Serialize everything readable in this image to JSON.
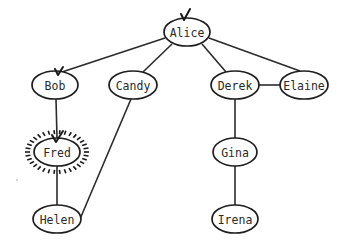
{
  "diagram": {
    "type": "graph",
    "colors": {
      "stroke": "#1e1e1e",
      "edge": "#2b2b2b",
      "background": "#ffffff",
      "label": "#2a2a2a"
    },
    "nodes": [
      {
        "id": "alice",
        "label": "Alice",
        "cx": 187,
        "cy": 32,
        "checked": true,
        "highlighted": false
      },
      {
        "id": "bob",
        "label": "Bob",
        "cx": 55,
        "cy": 85,
        "checked": true,
        "highlighted": false
      },
      {
        "id": "candy",
        "label": "Candy",
        "cx": 133,
        "cy": 85,
        "checked": false,
        "highlighted": false
      },
      {
        "id": "derek",
        "label": "Derek",
        "cx": 235,
        "cy": 85,
        "checked": false,
        "highlighted": false
      },
      {
        "id": "elaine",
        "label": "Elaine",
        "cx": 304,
        "cy": 85,
        "checked": false,
        "highlighted": false
      },
      {
        "id": "fred",
        "label": "Fred",
        "cx": 57,
        "cy": 152,
        "checked": true,
        "highlighted": true
      },
      {
        "id": "gina",
        "label": "Gina",
        "cx": 235,
        "cy": 152,
        "checked": false,
        "highlighted": false
      },
      {
        "id": "helen",
        "label": "Helen",
        "cx": 57,
        "cy": 219,
        "checked": false,
        "highlighted": false
      },
      {
        "id": "irena",
        "label": "Irena",
        "cx": 235,
        "cy": 219,
        "checked": false,
        "highlighted": false
      }
    ],
    "edges": [
      {
        "from": "Alice",
        "to": "Bob"
      },
      {
        "from": "Alice",
        "to": "Candy"
      },
      {
        "from": "Alice",
        "to": "Derek"
      },
      {
        "from": "Alice",
        "to": "Elaine"
      },
      {
        "from": "Derek",
        "to": "Elaine"
      },
      {
        "from": "Bob",
        "to": "Fred"
      },
      {
        "from": "Fred",
        "to": "Helen"
      },
      {
        "from": "Candy",
        "to": "Helen"
      },
      {
        "from": "Derek",
        "to": "Gina"
      },
      {
        "from": "Gina",
        "to": "Irena"
      }
    ]
  }
}
